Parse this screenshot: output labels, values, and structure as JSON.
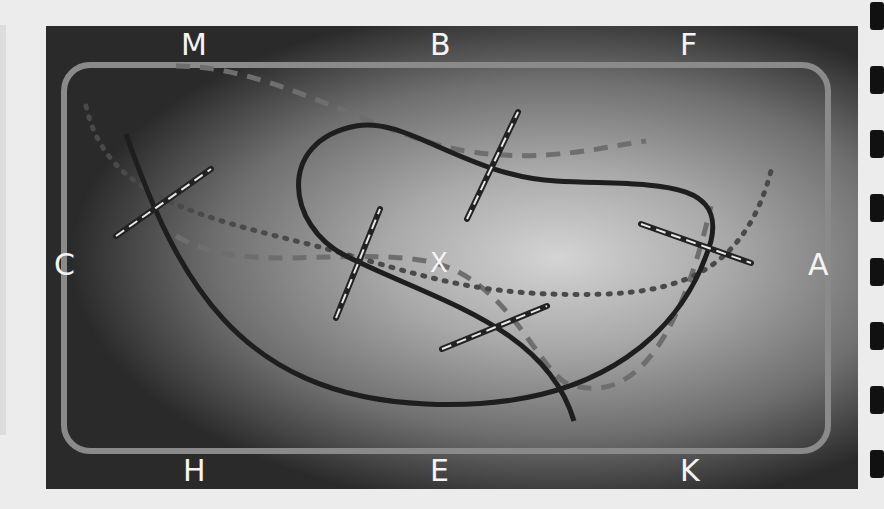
{
  "diagram": {
    "frame_labels": {
      "top": [
        "M",
        "B",
        "F"
      ],
      "left": "C",
      "right": "A",
      "bottom": [
        "H",
        "E",
        "K"
      ],
      "center": "X"
    },
    "colors": {
      "background": "#ececec",
      "frame_stroke": "#8a8a8a",
      "solid_curve": "#1e1e1e",
      "dashed_curve": "#6e6e6e",
      "dotted_curve": "#4a4a4a",
      "label": "#f4f4f4",
      "side_ticks": "#111111"
    },
    "elements": {
      "curves": [
        "solid-loop",
        "dashed-curve",
        "dotted-curve"
      ],
      "rulers_count": 5,
      "side_ticks_count": 8
    }
  }
}
